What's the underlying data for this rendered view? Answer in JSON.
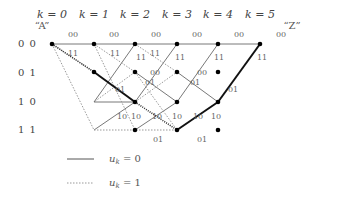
{
  "diagram": {
    "type": "trellis",
    "start_label": "“A”",
    "end_label": "“Z”",
    "time_labels": [
      "k = 0",
      "k = 1",
      "k = 2",
      "k = 3",
      "k = 4",
      "k = 5"
    ],
    "states": [
      "0 0",
      "0 1",
      "1 0",
      "1 1"
    ],
    "legend": [
      {
        "style": "solid",
        "label": "u",
        "sub": "k",
        "suffix": " = 0"
      },
      {
        "style": "dotted",
        "label": "u",
        "sub": "k",
        "suffix": " = 1"
      }
    ],
    "colors": {
      "edge": "#555555",
      "highlight": "#111111",
      "dotted": "#999999",
      "node": "#000000"
    }
  }
}
